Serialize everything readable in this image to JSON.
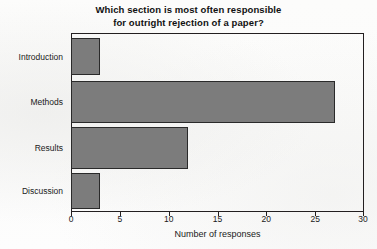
{
  "chart_data": {
    "type": "bar",
    "orientation": "horizontal",
    "title": "Which section is most often responsible for outright rejection of a paper?",
    "title_line1": "Which section is most often responsible",
    "title_line2": "for outright rejection of a paper?",
    "categories": [
      "Introduction",
      "Methods",
      "Results",
      "Discussion"
    ],
    "values": [
      3,
      27,
      12,
      3
    ],
    "xlabel": "Number of responses",
    "ylabel": "",
    "xlim": [
      0,
      30
    ],
    "xticks": [
      0,
      5,
      10,
      15,
      20,
      25,
      30
    ],
    "xtick_labels": [
      "0",
      "5",
      "10",
      "15",
      "20",
      "25",
      "30"
    ],
    "grid": false,
    "legend": false,
    "bar_color": "#7c7c7c",
    "bar_edge_color": "#2a2a2a",
    "frame_color": "#231f20",
    "background_color": "#fdfdfc"
  }
}
